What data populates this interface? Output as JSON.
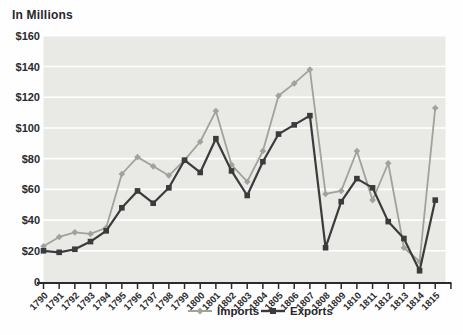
{
  "chart_data": {
    "type": "line",
    "title": "In Millions",
    "x": [
      1790,
      1791,
      1792,
      1793,
      1794,
      1795,
      1796,
      1797,
      1798,
      1799,
      1800,
      1801,
      1802,
      1803,
      1804,
      1805,
      1806,
      1807,
      1808,
      1809,
      1810,
      1811,
      1812,
      1813,
      1814,
      1815
    ],
    "series": [
      {
        "name": "Imports",
        "marker": "diamond",
        "color": "#a2a29a",
        "values": [
          23,
          29,
          32,
          31,
          35,
          70,
          81,
          75,
          69,
          79,
          91,
          111,
          76,
          65,
          85,
          121,
          129,
          138,
          57,
          59,
          85,
          53,
          77,
          22,
          13,
          113
        ]
      },
      {
        "name": "Exports",
        "marker": "square",
        "color": "#3b3b3d",
        "values": [
          20,
          19,
          21,
          26,
          33,
          48,
          59,
          51,
          61,
          79,
          71,
          93,
          72,
          56,
          78,
          96,
          102,
          108,
          22,
          52,
          67,
          61,
          39,
          28,
          7,
          53
        ]
      }
    ],
    "ylim": [
      0,
      160
    ],
    "yticks": [
      {
        "label": "$160",
        "value": 160
      },
      {
        "label": "$140",
        "value": 140
      },
      {
        "label": "$120",
        "value": 120
      },
      {
        "label": "$100",
        "value": 100
      },
      {
        "label": "$80",
        "value": 80
      },
      {
        "label": "$60",
        "value": 60
      },
      {
        "label": "$40",
        "value": 40
      },
      {
        "label": "$20",
        "value": 20
      },
      {
        "label": "0",
        "value": 0
      }
    ],
    "legend": {
      "items": [
        "Imports",
        "Exports"
      ],
      "position": "bottom-center"
    },
    "grid": {
      "horizontal": true,
      "vertical": false
    },
    "colors": {
      "plot_background": "#e9e9e6",
      "gridline": "#ffffff",
      "axis": "#2b2b2e",
      "text": "#2b2b2e"
    }
  }
}
